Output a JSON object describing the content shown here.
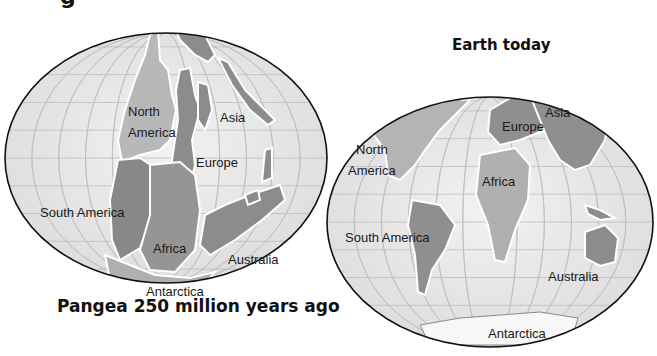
{
  "figure": {
    "title_fragment": "g",
    "maps": [
      {
        "id": "pangea",
        "caption": "Pangea 250 million years ago",
        "labels": {
          "north_america_1": "North",
          "north_america_2": "America",
          "asia": "Asia",
          "europe": "Europe",
          "south_america": "South America",
          "africa": "Africa",
          "australia": "Australia",
          "antarctica": "Antarctica"
        }
      },
      {
        "id": "earth-today",
        "caption": "Earth today",
        "labels": {
          "north_america_1": "North",
          "north_america_2": "America",
          "asia": "Asia",
          "europe": "Europe",
          "south_america": "South America",
          "africa": "Africa",
          "australia": "Australia",
          "antarctica": "Antarctica"
        }
      }
    ],
    "colors": {
      "ocean": "#ececec",
      "grid": "#bdbdbd",
      "land_dark": "#8a8a8a",
      "land_light": "#b4b4b4",
      "outline": "#111111"
    }
  }
}
